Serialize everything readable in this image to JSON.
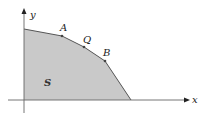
{
  "figure": {
    "axes": {
      "x_label": "x",
      "y_label": "y"
    },
    "region": {
      "label": "S",
      "fill": "#c8c8c8",
      "edge": "#555555",
      "vertices": [
        [
          24,
          29
        ],
        [
          62,
          36
        ],
        [
          84,
          47
        ],
        [
          105,
          61
        ],
        [
          131,
          100
        ],
        [
          24,
          100
        ]
      ]
    },
    "points": [
      {
        "label": "A",
        "x": 62,
        "y": 36
      },
      {
        "label": "Q",
        "x": 84,
        "y": 47
      },
      {
        "label": "B",
        "x": 105,
        "y": 61
      }
    ]
  }
}
